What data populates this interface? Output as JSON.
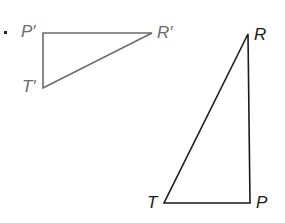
{
  "diagram": {
    "bullet": "•",
    "image_triangle": {
      "vertices": [
        {
          "label": "P′",
          "x": 43,
          "y": 33
        },
        {
          "label": "R′",
          "x": 152,
          "y": 33
        },
        {
          "label": "T′",
          "x": 43,
          "y": 88
        }
      ],
      "color": "#6b6b6b"
    },
    "preimage_triangle": {
      "vertices": [
        {
          "label": "R",
          "x": 248,
          "y": 34
        },
        {
          "label": "P",
          "x": 250,
          "y": 203
        },
        {
          "label": "T",
          "x": 164,
          "y": 203
        }
      ],
      "color": "#1a1a1a"
    }
  }
}
